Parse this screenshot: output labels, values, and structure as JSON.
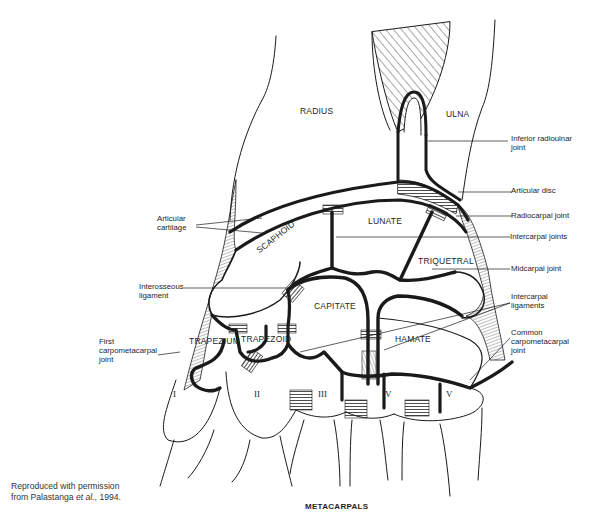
{
  "figure": {
    "bones": {
      "radius": "RADIUS",
      "ulna": "ULNA",
      "lunate": "LUNATE",
      "scaphoid": "SCAPHOID",
      "triquetral": "TRIQUETRAL",
      "capitate": "CAPITATE",
      "trapezium": "TRAPEZIUM",
      "trapezoid": "TRAPEZOID",
      "hamate": "HAMATE"
    },
    "metacarpal_numerals": [
      "I",
      "II",
      "III",
      "IV",
      "V"
    ],
    "bottom_label": "METACARPALS",
    "callouts_right": {
      "inferior_radioulnar_1": "Inferior radioulnar",
      "inferior_radioulnar_2": "joint",
      "articular_disc": "Articular disc",
      "radiocarpal_joint": "Radiocarpal joint",
      "intercarpal_joints": "Intercarpal joints",
      "midcarpal_joint": "Midcarpal joint",
      "intercarpal_ligaments_1": "Intercarpal",
      "intercarpal_ligaments_2": "ligaments",
      "common_cmc_1": "Common",
      "common_cmc_2": "carpometacarpal",
      "common_cmc_3": "joint"
    },
    "callouts_left": {
      "articular_cartilage_1": "Articular",
      "articular_cartilage_2": "cartilage",
      "interosseous_1": "Interosseous",
      "interosseous_2": "ligament",
      "first_cmc_1": "First",
      "first_cmc_2": "carpometacarpal",
      "first_cmc_3": "joint"
    },
    "caption": {
      "line1": "Reproduced with permission",
      "line2_prefix": "from Palastanga ",
      "line2_italic": "et al.",
      "line2_suffix": ", 1994."
    },
    "colors": {
      "ink": "#1a1a1a",
      "background": "#ffffff"
    }
  }
}
